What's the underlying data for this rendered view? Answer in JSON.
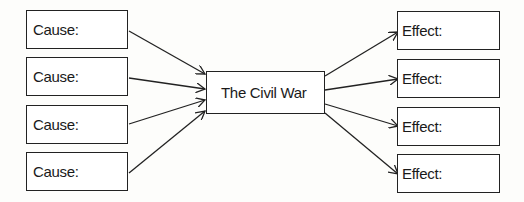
{
  "diagram": {
    "center": {
      "label": "The Civil War"
    },
    "causes": [
      {
        "label": "Cause:"
      },
      {
        "label": "Cause:"
      },
      {
        "label": "Cause:"
      },
      {
        "label": "Cause:"
      }
    ],
    "effects": [
      {
        "label": "Effect:"
      },
      {
        "label": "Effect:"
      },
      {
        "label": "Effect:"
      },
      {
        "label": "Effect:"
      }
    ]
  }
}
